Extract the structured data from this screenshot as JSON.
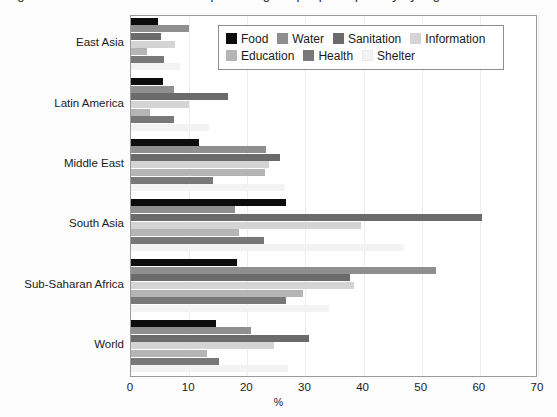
{
  "figure": {
    "title_sliver": "Figure 1. Unmet basic needs as a percentage of people in poverty by region",
    "xaxis_label": "%",
    "xticks": [
      "0",
      "10",
      "20",
      "30",
      "40",
      "50",
      "60",
      "70"
    ],
    "xlim": [
      0,
      70
    ],
    "grid": true,
    "frame": true
  },
  "legend": {
    "position": "top-right-inside",
    "rows": [
      [
        {
          "label": "Food",
          "color": "#0d0d0d"
        },
        {
          "label": "Water",
          "color": "#8f8f8f"
        },
        {
          "label": "Sanitation",
          "color": "#6b6b6b"
        },
        {
          "label": "Information",
          "color": "#d4d4d4"
        }
      ],
      [
        {
          "label": "Education",
          "color": "#b5b5b5"
        },
        {
          "label": "Health",
          "color": "#787878"
        },
        {
          "label": "Shelter",
          "color": "#f3f3f3"
        }
      ]
    ]
  },
  "chart_data": {
    "type": "bar",
    "orientation": "horizontal",
    "title": "Unmet basic needs as a percentage of people in poverty by region",
    "xlabel": "%",
    "ylabel": "",
    "xlim": [
      0,
      70
    ],
    "xticks": [
      0,
      10,
      20,
      30,
      40,
      50,
      60,
      70
    ],
    "grid": true,
    "categories": [
      "East Asia",
      "Latin America",
      "Middle East",
      "South Asia",
      "Sub-Saharan Africa",
      "World"
    ],
    "series": [
      {
        "name": "Food",
        "color": "#0d0d0d",
        "values": [
          4.7,
          5.5,
          11.7,
          26.6,
          18.3,
          14.6
        ]
      },
      {
        "name": "Water",
        "color": "#8f8f8f",
        "values": [
          10.0,
          7.4,
          23.3,
          17.9,
          52.4,
          20.6
        ]
      },
      {
        "name": "Sanitation",
        "color": "#6b6b6b",
        "values": [
          5.2,
          16.7,
          25.6,
          60.3,
          37.6,
          30.6
        ]
      },
      {
        "name": "Information",
        "color": "#d4d4d4",
        "values": [
          7.5,
          10.0,
          23.8,
          39.5,
          38.4,
          24.6
        ]
      },
      {
        "name": "Education",
        "color": "#b5b5b5",
        "values": [
          2.8,
          3.3,
          23.0,
          18.6,
          29.6,
          13.1
        ]
      },
      {
        "name": "Health",
        "color": "#787878",
        "values": [
          5.6,
          7.4,
          14.1,
          22.8,
          26.6,
          15.2
        ]
      },
      {
        "name": "Shelter",
        "color": "#f3f3f3",
        "values": [
          8.5,
          13.5,
          26.5,
          47.0,
          34.0,
          27.0
        ]
      }
    ]
  }
}
